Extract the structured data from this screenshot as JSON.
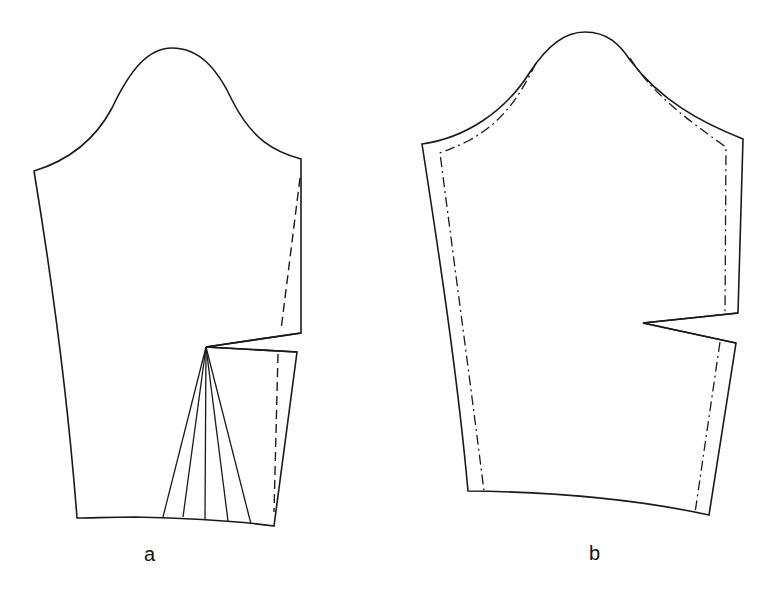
{
  "diagram": {
    "panels": [
      {
        "id": "a",
        "label": "a",
        "description": "Sleeve block with elbow dart and slash lines fanning to hem; dashed construction line along back seam"
      },
      {
        "id": "b",
        "label": "b",
        "description": "Finished sleeve pattern with elbow dart and dashed seam allowance line"
      }
    ],
    "colors": {
      "line": "#1a1a1a",
      "background": "#ffffff"
    }
  }
}
